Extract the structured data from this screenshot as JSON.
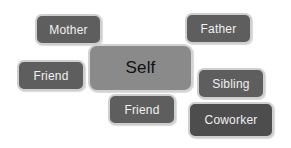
{
  "diagram": {
    "type": "relationship-map",
    "center": {
      "label": "Self"
    },
    "nodes": [
      {
        "id": "mother",
        "label": "Mother"
      },
      {
        "id": "father",
        "label": "Father"
      },
      {
        "id": "friend_left",
        "label": "Friend"
      },
      {
        "id": "sibling",
        "label": "Sibling"
      },
      {
        "id": "friend_center",
        "label": "Friend"
      },
      {
        "id": "coworker",
        "label": "Coworker"
      }
    ],
    "colors": {
      "node_fill": "#5e5e5e",
      "center_fill": "#8a8a8a",
      "node_text": "#f0f0f0",
      "center_text": "#111111",
      "border": "#cfcfcf"
    }
  }
}
